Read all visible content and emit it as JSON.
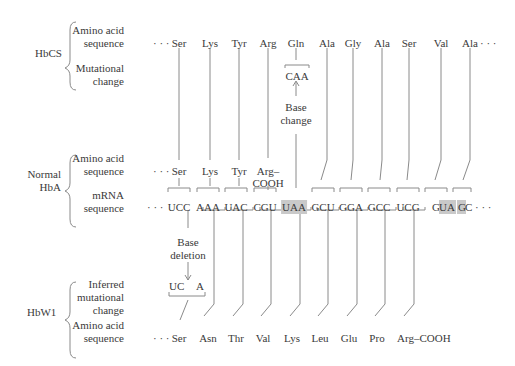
{
  "rows": {
    "hbcs": {
      "label": "HbCS",
      "sub1": [
        "Amino acid",
        "sequence"
      ],
      "sub2": [
        "Mutational",
        "change"
      ],
      "prefix": "· · ·",
      "amino_acids": [
        "Ser",
        "Lys",
        "Tyr",
        "Arg",
        "Gln",
        "Ala",
        "Gly",
        "Ala",
        "Ser",
        "Val",
        "Ala"
      ],
      "suffix": "· · ·",
      "mutated_codon": "CAA",
      "base_change_label": [
        "Base",
        "change"
      ]
    },
    "hba": {
      "label": [
        "Normal",
        "HbA"
      ],
      "sub1": [
        "Amino acid",
        "sequence"
      ],
      "sub2": [
        "mRNA",
        "sequence"
      ],
      "prefix": "· · ·",
      "amino_acids": [
        "Ser",
        "Lys",
        "Tyr",
        "Arg–",
        "COOH"
      ],
      "codons": [
        "UCC",
        "AAA",
        "UAC",
        "CGU",
        "UAA",
        "GCU",
        "GGA",
        "GCC",
        "UCG",
        "GUA",
        "GC"
      ],
      "codon_prefix": "G",
      "highlighted": [
        "UAA",
        "UA",
        "G"
      ],
      "suffix": "· · ·"
    },
    "hbw1": {
      "label": "HbW1",
      "sub1": [
        "Inferred",
        "mutational",
        "change"
      ],
      "sub2": [
        "Amino acid",
        "sequence"
      ],
      "base_deletion_label": [
        "Base",
        "deletion"
      ],
      "deleted_codon_left": "UC",
      "deleted_codon_right": "A",
      "prefix": "· · ·",
      "amino_acids": [
        "Ser",
        "Asn",
        "Thr",
        "Val",
        "Lys",
        "Leu",
        "Glu",
        "Pro",
        "Arg–COOH"
      ]
    }
  },
  "colors": {
    "line": "#8a8a8a",
    "text": "#3a3a3a",
    "highlight": "#c9c9c9"
  }
}
